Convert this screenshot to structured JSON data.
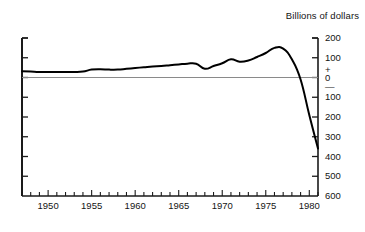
{
  "chart_data": {
    "type": "line",
    "title": "Billions of dollars",
    "xlabel": "",
    "ylabel": "",
    "grid": false,
    "legend": "none",
    "zero_reference_line": true,
    "xlim": [
      1947,
      1981
    ],
    "ylim": [
      -600,
      200
    ],
    "y_axis_position": "right",
    "y_axis_note": "Values below zero are printed without a minus sign; a plus sign above 0 and a minus sign below 0 mark the polarity.",
    "yticks": [
      200,
      100,
      0,
      -100,
      -200,
      -300,
      -400,
      -500,
      -600
    ],
    "ytick_labels": [
      "200",
      "100",
      "0",
      "100",
      "200",
      "300",
      "400",
      "500",
      "600"
    ],
    "y_sign_plus": "+",
    "y_sign_minus": "—",
    "xticks": [
      1950,
      1955,
      1960,
      1965,
      1970,
      1975,
      1980
    ],
    "xtick_labels": [
      "1950",
      "1955",
      "1960",
      "1965",
      "1970",
      "1975",
      "1980"
    ],
    "x_minor_tick_interval": 1,
    "x": [
      1947,
      1948,
      1949,
      1950,
      1951,
      1952,
      1953,
      1954,
      1955,
      1956,
      1957,
      1958,
      1959,
      1960,
      1961,
      1962,
      1963,
      1964,
      1965,
      1966,
      1967,
      1968,
      1969,
      1970,
      1971,
      1972,
      1973,
      1974,
      1975,
      1976,
      1977,
      1978,
      1979,
      1980,
      1981
    ],
    "values": [
      32,
      30,
      28,
      28,
      28,
      28,
      28,
      30,
      40,
      42,
      40,
      40,
      44,
      48,
      52,
      56,
      58,
      62,
      66,
      70,
      70,
      44,
      58,
      72,
      92,
      80,
      86,
      104,
      124,
      150,
      146,
      92,
      -10,
      -190,
      -360
    ],
    "series": [
      {
        "name": "value",
        "color": "#000000",
        "line_width": 2,
        "values": [
          32,
          30,
          28,
          28,
          28,
          28,
          28,
          30,
          40,
          42,
          40,
          40,
          44,
          48,
          52,
          56,
          58,
          62,
          66,
          70,
          70,
          44,
          58,
          72,
          92,
          80,
          86,
          104,
          124,
          150,
          146,
          92,
          -10,
          -190,
          -360
        ]
      }
    ],
    "annotations": [],
    "colors": {
      "axis": "#1a1a1a",
      "line": "#000000",
      "zero_line": "#8a8a8a",
      "background": "#ffffff",
      "text": "#141414"
    }
  }
}
